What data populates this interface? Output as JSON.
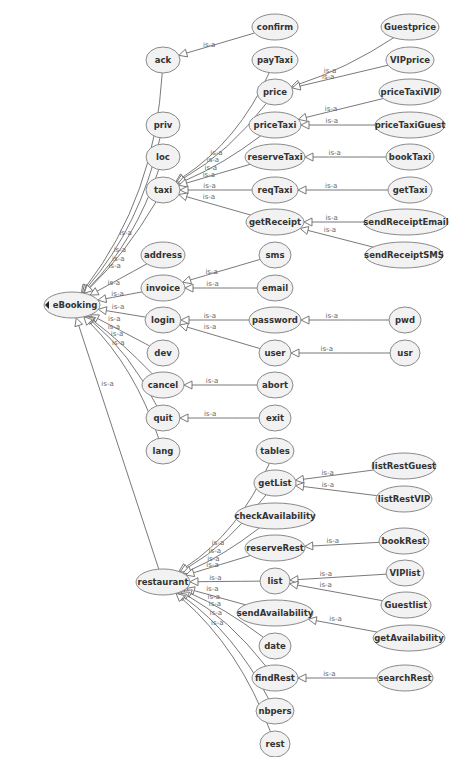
{
  "diagram": {
    "relation_label": "is-a",
    "colors": {
      "node_fill": "#f2f2f2",
      "node_stroke": "#8a8a8a",
      "edge": "#6a6a6a",
      "text": "#333333"
    },
    "nodes": [
      {
        "id": "eBooking",
        "label": "eBooking",
        "x": 72,
        "y": 305,
        "rx": 28,
        "ry": 13,
        "root": true
      },
      {
        "id": "ack",
        "label": "ack",
        "x": 163,
        "y": 60,
        "rx": 17,
        "ry": 13
      },
      {
        "id": "priv",
        "label": "priv",
        "x": 163,
        "y": 125,
        "rx": 17,
        "ry": 13
      },
      {
        "id": "loc",
        "label": "loc",
        "x": 163,
        "y": 157,
        "rx": 17,
        "ry": 13
      },
      {
        "id": "taxi",
        "label": "taxi",
        "x": 163,
        "y": 190,
        "rx": 17,
        "ry": 13
      },
      {
        "id": "address",
        "label": "address",
        "x": 163,
        "y": 255,
        "rx": 22,
        "ry": 13
      },
      {
        "id": "invoice",
        "label": "invoice",
        "x": 163,
        "y": 288,
        "rx": 22,
        "ry": 13
      },
      {
        "id": "login",
        "label": "login",
        "x": 163,
        "y": 320,
        "rx": 18,
        "ry": 13
      },
      {
        "id": "dev",
        "label": "dev",
        "x": 163,
        "y": 353,
        "rx": 16,
        "ry": 13
      },
      {
        "id": "cancel",
        "label": "cancel",
        "x": 163,
        "y": 385,
        "rx": 21,
        "ry": 13
      },
      {
        "id": "quit",
        "label": "quit",
        "x": 163,
        "y": 418,
        "rx": 17,
        "ry": 13
      },
      {
        "id": "lang",
        "label": "lang",
        "x": 163,
        "y": 451,
        "rx": 17,
        "ry": 13
      },
      {
        "id": "restaurant",
        "label": "restaurant",
        "x": 163,
        "y": 582,
        "rx": 27,
        "ry": 13
      },
      {
        "id": "confirm",
        "label": "confirm",
        "x": 275,
        "y": 27,
        "rx": 23,
        "ry": 13
      },
      {
        "id": "payTaxi",
        "label": "payTaxi",
        "x": 275,
        "y": 60,
        "rx": 23,
        "ry": 13
      },
      {
        "id": "price",
        "label": "price",
        "x": 275,
        "y": 92,
        "rx": 18,
        "ry": 13
      },
      {
        "id": "priceTaxi",
        "label": "priceTaxi",
        "x": 275,
        "y": 125,
        "rx": 26,
        "ry": 13
      },
      {
        "id": "reserveTaxi",
        "label": "reserveTaxi",
        "x": 275,
        "y": 157,
        "rx": 30,
        "ry": 13
      },
      {
        "id": "reqTaxi",
        "label": "reqTaxi",
        "x": 275,
        "y": 190,
        "rx": 23,
        "ry": 13
      },
      {
        "id": "getReceipt",
        "label": "getReceipt",
        "x": 275,
        "y": 222,
        "rx": 29,
        "ry": 13
      },
      {
        "id": "sms",
        "label": "sms",
        "x": 275,
        "y": 255,
        "rx": 16,
        "ry": 13
      },
      {
        "id": "email",
        "label": "email",
        "x": 275,
        "y": 288,
        "rx": 18,
        "ry": 13
      },
      {
        "id": "password",
        "label": "password",
        "x": 275,
        "y": 320,
        "rx": 26,
        "ry": 13
      },
      {
        "id": "user",
        "label": "user",
        "x": 275,
        "y": 353,
        "rx": 16,
        "ry": 13
      },
      {
        "id": "abort",
        "label": "abort",
        "x": 275,
        "y": 385,
        "rx": 18,
        "ry": 13
      },
      {
        "id": "exit",
        "label": "exit",
        "x": 275,
        "y": 418,
        "rx": 16,
        "ry": 13
      },
      {
        "id": "tables",
        "label": "tables",
        "x": 275,
        "y": 451,
        "rx": 19,
        "ry": 13
      },
      {
        "id": "getList",
        "label": "getList",
        "x": 275,
        "y": 483,
        "rx": 21,
        "ry": 13
      },
      {
        "id": "checkAvailability",
        "label": "checkAvailability",
        "x": 275,
        "y": 516,
        "rx": 40,
        "ry": 13
      },
      {
        "id": "reserveRest",
        "label": "reserveRest",
        "x": 275,
        "y": 548,
        "rx": 30,
        "ry": 13
      },
      {
        "id": "list",
        "label": "list",
        "x": 275,
        "y": 581,
        "rx": 15,
        "ry": 13
      },
      {
        "id": "sendAvailability",
        "label": "sendAvailability",
        "x": 275,
        "y": 613,
        "rx": 38,
        "ry": 13
      },
      {
        "id": "date",
        "label": "date",
        "x": 275,
        "y": 646,
        "rx": 16,
        "ry": 13
      },
      {
        "id": "findRest",
        "label": "findRest",
        "x": 275,
        "y": 678,
        "rx": 23,
        "ry": 13
      },
      {
        "id": "nbpers",
        "label": "nbpers",
        "x": 275,
        "y": 711,
        "rx": 19,
        "ry": 13
      },
      {
        "id": "rest",
        "label": "rest",
        "x": 275,
        "y": 744,
        "rx": 15,
        "ry": 13
      },
      {
        "id": "Guestprice",
        "label": "Guestprice",
        "x": 410,
        "y": 27,
        "rx": 29,
        "ry": 13
      },
      {
        "id": "VIPprice",
        "label": "VIPprice",
        "x": 410,
        "y": 60,
        "rx": 24,
        "ry": 13
      },
      {
        "id": "priceTaxiVIP",
        "label": "priceTaxiVIP",
        "x": 410,
        "y": 92,
        "rx": 31,
        "ry": 13
      },
      {
        "id": "priceTaxiGuest",
        "label": "priceTaxiGuest",
        "x": 410,
        "y": 125,
        "rx": 35,
        "ry": 13
      },
      {
        "id": "bookTaxi",
        "label": "bookTaxi",
        "x": 410,
        "y": 157,
        "rx": 24,
        "ry": 13
      },
      {
        "id": "getTaxi",
        "label": "getTaxi",
        "x": 410,
        "y": 190,
        "rx": 22,
        "ry": 13
      },
      {
        "id": "sendReceiptEmail",
        "label": "sendReceiptEmail",
        "x": 406,
        "y": 222,
        "rx": 42,
        "ry": 13
      },
      {
        "id": "sendReceiptSMS",
        "label": "sendReceiptSMS",
        "x": 404,
        "y": 255,
        "rx": 39,
        "ry": 13
      },
      {
        "id": "pwd",
        "label": "pwd",
        "x": 405,
        "y": 320,
        "rx": 16,
        "ry": 13
      },
      {
        "id": "usr",
        "label": "usr",
        "x": 405,
        "y": 353,
        "rx": 15,
        "ry": 13
      },
      {
        "id": "listRestGuest",
        "label": "listRestGuest",
        "x": 404,
        "y": 466,
        "rx": 32,
        "ry": 13
      },
      {
        "id": "listRestVIP",
        "label": "listRestVIP",
        "x": 404,
        "y": 499,
        "rx": 28,
        "ry": 13
      },
      {
        "id": "bookRest",
        "label": "bookRest",
        "x": 404,
        "y": 541,
        "rx": 25,
        "ry": 13
      },
      {
        "id": "VIPlist",
        "label": "VIPlist",
        "x": 405,
        "y": 573,
        "rx": 19,
        "ry": 13
      },
      {
        "id": "Guestlist",
        "label": "Guestlist",
        "x": 406,
        "y": 605,
        "rx": 25,
        "ry": 13
      },
      {
        "id": "getAvailability",
        "label": "getAvailability",
        "x": 409,
        "y": 638,
        "rx": 36,
        "ry": 13
      },
      {
        "id": "searchRest",
        "label": "searchRest",
        "x": 405,
        "y": 678,
        "rx": 28,
        "ry": 13
      }
    ],
    "edges": [
      {
        "from": "ack",
        "to": "eBooking",
        "label": "is-a",
        "curve": -40
      },
      {
        "from": "priv",
        "to": "eBooking",
        "label": "is-a",
        "curve": -25
      },
      {
        "from": "loc",
        "to": "eBooking",
        "label": "is-a",
        "curve": -20
      },
      {
        "from": "taxi",
        "to": "eBooking",
        "label": "is-a",
        "curve": -10
      },
      {
        "from": "address",
        "to": "eBooking",
        "label": "is-a",
        "curve": 0
      },
      {
        "from": "invoice",
        "to": "eBooking",
        "label": "is-a",
        "curve": 0
      },
      {
        "from": "login",
        "to": "eBooking",
        "label": "is-a",
        "curve": 0
      },
      {
        "from": "dev",
        "to": "eBooking",
        "label": "is-a",
        "curve": 0
      },
      {
        "from": "cancel",
        "to": "eBooking",
        "label": "is-a",
        "curve": 5
      },
      {
        "from": "quit",
        "to": "eBooking",
        "label": "is-a",
        "curve": 15
      },
      {
        "from": "lang",
        "to": "eBooking",
        "label": "is-a",
        "curve": 20
      },
      {
        "from": "restaurant",
        "to": "eBooking",
        "label": "is-a",
        "curve": 0
      },
      {
        "from": "confirm",
        "to": "ack",
        "label": "is-a",
        "curve": 0
      },
      {
        "from": "payTaxi",
        "to": "taxi",
        "label": "is-a",
        "curve": -25
      },
      {
        "from": "price",
        "to": "taxi",
        "label": "is-a",
        "curve": -15
      },
      {
        "from": "priceTaxi",
        "to": "taxi",
        "label": "is-a",
        "curve": -8
      },
      {
        "from": "reserveTaxi",
        "to": "taxi",
        "label": "is-a",
        "curve": 0
      },
      {
        "from": "reqTaxi",
        "to": "taxi",
        "label": "is-a",
        "curve": 0
      },
      {
        "from": "getReceipt",
        "to": "taxi",
        "label": "is-a",
        "curve": 0
      },
      {
        "from": "Guestprice",
        "to": "price",
        "label": "is-a",
        "curve": -10
      },
      {
        "from": "VIPprice",
        "to": "price",
        "label": "is-a",
        "curve": 0
      },
      {
        "from": "priceTaxiVIP",
        "to": "priceTaxi",
        "label": "is-a",
        "curve": 0
      },
      {
        "from": "priceTaxiGuest",
        "to": "priceTaxi",
        "label": "is-a",
        "curve": 0
      },
      {
        "from": "bookTaxi",
        "to": "reserveTaxi",
        "label": "is-a",
        "curve": 0
      },
      {
        "from": "getTaxi",
        "to": "reqTaxi",
        "label": "is-a",
        "curve": 0
      },
      {
        "from": "sendReceiptEmail",
        "to": "getReceipt",
        "label": "is-a",
        "curve": 0
      },
      {
        "from": "sendReceiptSMS",
        "to": "getReceipt",
        "label": "is-a",
        "curve": 0
      },
      {
        "from": "sms",
        "to": "invoice",
        "label": "is-a",
        "curve": 0
      },
      {
        "from": "email",
        "to": "invoice",
        "label": "is-a",
        "curve": 0
      },
      {
        "from": "password",
        "to": "login",
        "label": "is-a",
        "curve": 0
      },
      {
        "from": "user",
        "to": "login",
        "label": "is-a",
        "curve": 0
      },
      {
        "from": "pwd",
        "to": "password",
        "label": "is-a",
        "curve": 0
      },
      {
        "from": "usr",
        "to": "user",
        "label": "is-a",
        "curve": 0
      },
      {
        "from": "abort",
        "to": "cancel",
        "label": "is-a",
        "curve": 0
      },
      {
        "from": "exit",
        "to": "quit",
        "label": "is-a",
        "curve": 0
      },
      {
        "from": "tables",
        "to": "restaurant",
        "label": "is-a",
        "curve": -25
      },
      {
        "from": "getList",
        "to": "restaurant",
        "label": "is-a",
        "curve": -15
      },
      {
        "from": "checkAvailability",
        "to": "restaurant",
        "label": "is-a",
        "curve": -8
      },
      {
        "from": "reserveRest",
        "to": "restaurant",
        "label": "is-a",
        "curve": 0
      },
      {
        "from": "list",
        "to": "restaurant",
        "label": "is-a",
        "curve": 0
      },
      {
        "from": "sendAvailability",
        "to": "restaurant",
        "label": "is-a",
        "curve": 0
      },
      {
        "from": "date",
        "to": "restaurant",
        "label": "is-a",
        "curve": 8
      },
      {
        "from": "findRest",
        "to": "restaurant",
        "label": "is-a",
        "curve": 15
      },
      {
        "from": "nbpers",
        "to": "restaurant",
        "label": "is-a",
        "curve": 20
      },
      {
        "from": "rest",
        "to": "restaurant",
        "label": "is-a",
        "curve": 25
      },
      {
        "from": "listRestGuest",
        "to": "getList",
        "label": "is-a",
        "curve": 0
      },
      {
        "from": "listRestVIP",
        "to": "getList",
        "label": "is-a",
        "curve": 0
      },
      {
        "from": "bookRest",
        "to": "reserveRest",
        "label": "is-a",
        "curve": 0
      },
      {
        "from": "VIPlist",
        "to": "list",
        "label": "is-a",
        "curve": 0
      },
      {
        "from": "Guestlist",
        "to": "list",
        "label": "is-a",
        "curve": 0
      },
      {
        "from": "getAvailability",
        "to": "sendAvailability",
        "label": "is-a",
        "curve": 0
      },
      {
        "from": "searchRest",
        "to": "findRest",
        "label": "is-a",
        "curve": 0
      }
    ]
  }
}
